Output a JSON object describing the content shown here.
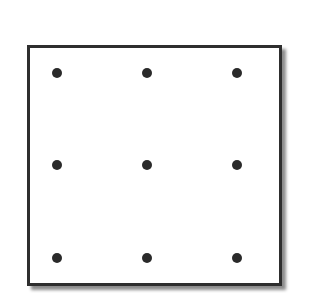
{
  "diagram": {
    "type": "nine-dot-grid",
    "rows": 3,
    "cols": 3,
    "dot_color": "#2a2a2a",
    "border_color": "#2e2e2e",
    "dots": [
      {
        "row": 0,
        "col": 0,
        "x": 57,
        "y": 73
      },
      {
        "row": 0,
        "col": 1,
        "x": 147,
        "y": 73
      },
      {
        "row": 0,
        "col": 2,
        "x": 237,
        "y": 73
      },
      {
        "row": 1,
        "col": 0,
        "x": 57,
        "y": 165
      },
      {
        "row": 1,
        "col": 1,
        "x": 147,
        "y": 165
      },
      {
        "row": 1,
        "col": 2,
        "x": 237,
        "y": 165
      },
      {
        "row": 2,
        "col": 0,
        "x": 57,
        "y": 258
      },
      {
        "row": 2,
        "col": 1,
        "x": 147,
        "y": 258
      },
      {
        "row": 2,
        "col": 2,
        "x": 237,
        "y": 258
      }
    ]
  }
}
